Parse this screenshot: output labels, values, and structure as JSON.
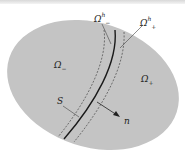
{
  "diagram": {
    "regions": [
      {
        "id": "omega-minus",
        "label": "Ω",
        "sub": "−"
      },
      {
        "id": "omega-plus",
        "label": "Ω",
        "sub": "+"
      }
    ],
    "bands": [
      {
        "id": "omega-minus-h",
        "label": "Ω",
        "sup": "h",
        "sub": "−"
      },
      {
        "id": "omega-plus-h",
        "label": "Ω",
        "sup": "h",
        "sub": "+"
      }
    ],
    "interface": {
      "label": "S"
    },
    "normal": {
      "label": "n"
    },
    "colors": {
      "domain_fill": "#c4c4c4",
      "curve": "#1a1a1a",
      "dashed": "#555555"
    }
  }
}
